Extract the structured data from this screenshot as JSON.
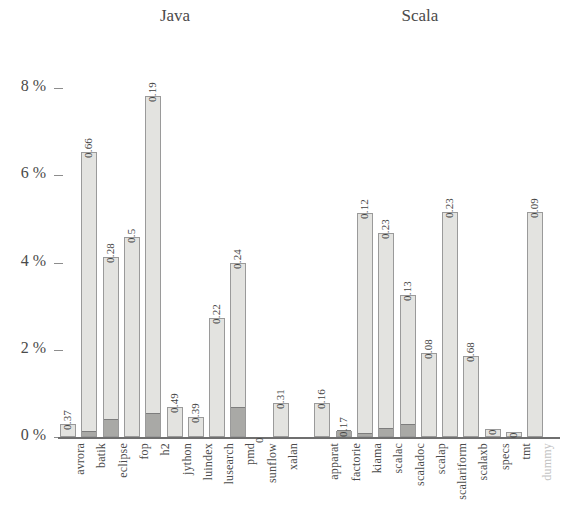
{
  "chart_data": {
    "type": "bar",
    "title": "",
    "subtitle": "",
    "xlabel": "",
    "ylabel": "",
    "ylim": [
      0,
      8.4
    ],
    "yticks": [
      0,
      2,
      4,
      6,
      8
    ],
    "ytick_labels": [
      "0 %",
      "2 %",
      "4 %",
      "6 %",
      "8 %"
    ],
    "grid": false,
    "legend": null,
    "group_headers": [
      {
        "label": "Java",
        "center_x": 175
      },
      {
        "label": "Scala",
        "center_x": 417
      }
    ],
    "categories": [
      "avrora",
      "batik",
      "eclipse",
      "fop",
      "h2",
      "jython",
      "luindex",
      "lusearch",
      "pmd",
      "sunflow",
      "xalan",
      "apparat",
      "factorie",
      "kiama",
      "scalac",
      "scaladoc",
      "scalap",
      "scalariform",
      "scalaxb",
      "specs",
      "tmt",
      "dummy"
    ],
    "series": [
      {
        "name": "total",
        "values": [
          0.3,
          6.53,
          4.13,
          4.58,
          7.81,
          0.69,
          0.46,
          2.72,
          4.0,
          0.0,
          0.78,
          0.78,
          0.13,
          5.13,
          4.68,
          3.26,
          1.93,
          5.17,
          1.86,
          0.18,
          0.11,
          5.17
        ]
      },
      {
        "name": "dark-sub-segment",
        "values": [
          0.0,
          0.12,
          0.39,
          0.0,
          0.52,
          0.0,
          0.0,
          0.0,
          0.67,
          0.0,
          0.0,
          0.0,
          0.14,
          0.07,
          0.18,
          0.28,
          0.0,
          0.0,
          0.0,
          0.0,
          0.0,
          0.0
        ]
      }
    ],
    "point_labels": [
      "0.37",
      "0.66",
      "0.28",
      "0.5",
      "0.19",
      "0.49",
      "0.39",
      "0.22",
      "0.24",
      "0",
      "0.31",
      "0.16",
      "0.17",
      "0.12",
      "0.23",
      "0.13",
      "0.08",
      "0.23",
      "0.68",
      "0",
      "0",
      "0.09"
    ],
    "faded_categories": [
      "dummy"
    ],
    "colors": {
      "bar_fill": "#e3e3e0",
      "bar_dark_fill": "#a9a9a6",
      "bar_stroke": "#9a9a9a",
      "axis": "#6f6f6f",
      "text": "#4a4a4a",
      "faded_text": "#c2c2c2"
    }
  }
}
